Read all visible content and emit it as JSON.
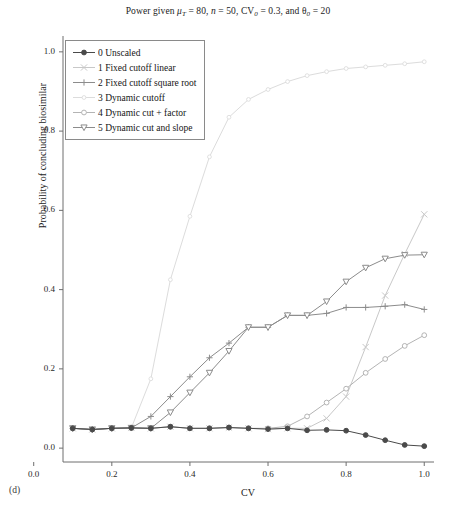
{
  "figure": {
    "panel_label": "(d)",
    "title_plain": "Power given μT = 80, n = 50, CV0 = 0.3, and θ0 = 20",
    "title_parts": {
      "lead": "Power given ",
      "mu": "μ",
      "mu_sub": "T",
      "mu_val": " = 80, ",
      "n": "n",
      "n_val": " = 50, ",
      "cv": "CV",
      "cv_sub": "0",
      "cv_val": " = 0.3, and ",
      "theta": "θ",
      "theta_sub": "0",
      "theta_val": " = 20"
    }
  },
  "chart_data": {
    "type": "line",
    "title": "Power given μT = 80, n = 50, CV0 = 0.3, and θ0 = 20",
    "xlabel": "CV",
    "ylabel": "Probability of concluding biosimilar",
    "xlim": [
      0.075,
      1.025
    ],
    "ylim": [
      -0.035,
      1.04
    ],
    "xticks": [
      0.0,
      0.2,
      0.4,
      0.6,
      0.8,
      1.0
    ],
    "xtick_labels": [
      "0.0",
      "0.2",
      "0.4",
      "0.6",
      "0.8",
      "1.0"
    ],
    "yticks": [
      0.0,
      0.2,
      0.4,
      0.6,
      0.8,
      1.0
    ],
    "ytick_labels": [
      "0.0",
      "0.2",
      "0.4",
      "0.6",
      "0.8",
      "1.0"
    ],
    "grid": false,
    "legend_position": "upper left",
    "x": [
      0.1,
      0.15,
      0.2,
      0.25,
      0.3,
      0.35,
      0.4,
      0.45,
      0.5,
      0.55,
      0.6,
      0.65,
      0.7,
      0.75,
      0.8,
      0.85,
      0.9,
      0.95,
      1.0
    ],
    "series": [
      {
        "name": "0 Unscaled",
        "index": 0,
        "marker": "circle-filled",
        "color": "#4a4a4a",
        "values": [
          0.05,
          0.047,
          0.05,
          0.051,
          0.05,
          0.054,
          0.05,
          0.05,
          0.052,
          0.05,
          0.048,
          0.05,
          0.045,
          0.046,
          0.044,
          0.033,
          0.02,
          0.008,
          0.005
        ]
      },
      {
        "name": "1 Fixed cutoff linear",
        "index": 1,
        "marker": "x-thin",
        "color": "#c8c8c8",
        "values": [
          0.05,
          0.047,
          0.05,
          0.051,
          0.05,
          0.054,
          0.05,
          0.05,
          0.052,
          0.05,
          0.048,
          0.05,
          0.05,
          0.075,
          0.13,
          0.255,
          0.385,
          0.49,
          0.59
        ]
      },
      {
        "name": "2 Fixed cutoff square root",
        "index": 2,
        "marker": "plus",
        "color": "#8c8c8c",
        "values": [
          0.05,
          0.047,
          0.05,
          0.051,
          0.08,
          0.13,
          0.18,
          0.228,
          0.265,
          0.305,
          0.305,
          0.335,
          0.335,
          0.34,
          0.355,
          0.355,
          0.358,
          0.362,
          0.35
        ]
      },
      {
        "name": "3 Dynamic cutoff",
        "index": 3,
        "marker": "dot-light",
        "color": "#dcdcdc",
        "values": [
          0.05,
          0.047,
          0.05,
          0.051,
          0.175,
          0.425,
          0.585,
          0.735,
          0.835,
          0.88,
          0.905,
          0.925,
          0.94,
          0.95,
          0.958,
          0.962,
          0.966,
          0.97,
          0.975
        ]
      },
      {
        "name": "4 Dynamic cut + factor",
        "index": 4,
        "marker": "circle-open",
        "color": "#b4b4b4",
        "values": [
          0.05,
          0.047,
          0.05,
          0.051,
          0.05,
          0.054,
          0.05,
          0.05,
          0.052,
          0.05,
          0.05,
          0.055,
          0.08,
          0.115,
          0.15,
          0.19,
          0.225,
          0.258,
          0.285
        ]
      },
      {
        "name": "5 Dynamic cut and slope",
        "index": 5,
        "marker": "triangle-down",
        "color": "#8c8c8c",
        "values": [
          0.05,
          0.047,
          0.05,
          0.051,
          0.05,
          0.09,
          0.14,
          0.19,
          0.245,
          0.305,
          0.305,
          0.335,
          0.335,
          0.37,
          0.42,
          0.455,
          0.478,
          0.487,
          0.488
        ]
      }
    ]
  }
}
